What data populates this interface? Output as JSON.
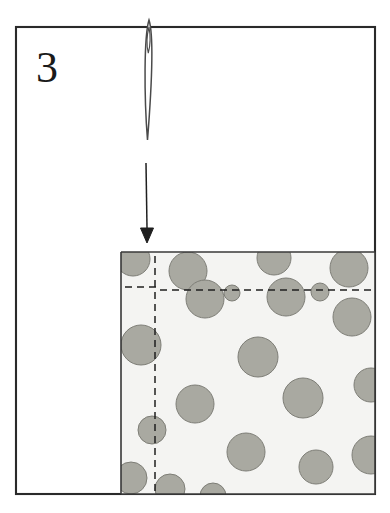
{
  "figure": {
    "kind": "sewing-instruction-diagram",
    "step_number": "3",
    "caption": "",
    "frame": {
      "name": "illustration-border",
      "x": 16,
      "y": 27,
      "width": 359,
      "height": 467,
      "stroke": "#2b2b2b",
      "fill": "#ffffff"
    }
  },
  "needle": {
    "name": "sewing-needle",
    "label": "needle",
    "tip_x": 149,
    "top_y": 20,
    "bottom_y": 140,
    "half_width": 5,
    "eye_top_y": 27,
    "eye_bottom_y": 53,
    "stroke": "#4a4a4a"
  },
  "arrow": {
    "name": "direction-arrow",
    "label": "fold direction arrow",
    "x": 146,
    "y_start": 163,
    "y_end": 243,
    "head_width": 13,
    "head_height": 16,
    "stroke": "#1f1f1f"
  },
  "fabric": {
    "name": "polka-dot-fabric",
    "label": "polka dot fabric piece",
    "x": 121,
    "y": 252,
    "width": 254,
    "height": 242,
    "background": "#f4f4f2",
    "outline": "#3a3a3a",
    "dot_fill": "#a9a9a1",
    "dot_stroke": "#7d7d76",
    "dots": [
      {
        "cx": 133,
        "cy": 259,
        "r": 17
      },
      {
        "cx": 188,
        "cy": 271,
        "r": 19
      },
      {
        "cx": 274,
        "cy": 258,
        "r": 17
      },
      {
        "cx": 349,
        "cy": 268,
        "r": 19
      },
      {
        "cx": 232,
        "cy": 293,
        "r": 8
      },
      {
        "cx": 320,
        "cy": 292,
        "r": 9
      },
      {
        "cx": 205,
        "cy": 299,
        "r": 19
      },
      {
        "cx": 286,
        "cy": 297,
        "r": 19
      },
      {
        "cx": 352,
        "cy": 317,
        "r": 19
      },
      {
        "cx": 141,
        "cy": 345,
        "r": 20
      },
      {
        "cx": 258,
        "cy": 357,
        "r": 20
      },
      {
        "cx": 195,
        "cy": 404,
        "r": 19
      },
      {
        "cx": 303,
        "cy": 398,
        "r": 20
      },
      {
        "cx": 371,
        "cy": 385,
        "r": 17
      },
      {
        "cx": 152,
        "cy": 430,
        "r": 14
      },
      {
        "cx": 246,
        "cy": 452,
        "r": 19
      },
      {
        "cx": 316,
        "cy": 467,
        "r": 17
      },
      {
        "cx": 371,
        "cy": 455,
        "r": 19
      },
      {
        "cx": 131,
        "cy": 478,
        "r": 16
      },
      {
        "cx": 170,
        "cy": 489,
        "r": 15
      },
      {
        "cx": 213,
        "cy": 496,
        "r": 13
      }
    ]
  },
  "fold_strip": {
    "name": "left-fold-strip",
    "label": "folded left edge",
    "left_x": 121,
    "right_x": 160,
    "dashed_x": 155,
    "top_y": 252,
    "bottom_y": 494,
    "stroke": "#3a3a3a",
    "dash_stroke": "#1f1f1f"
  },
  "top_fold": {
    "name": "top-fold-line",
    "label": "folded top edge",
    "left_dash_x1": 125,
    "left_dash_x2": 157,
    "left_dash_y": 287,
    "right_dash_x1": 160,
    "right_dash_x2": 375,
    "right_dash_y": 290,
    "solid_y": 293,
    "solid_x1": 160,
    "solid_x2": 375,
    "stroke": "#1f1f1f"
  },
  "colors": {
    "ink": "#1f1f1f",
    "frame_stroke": "#2b2b2b",
    "fabric_bg": "#f4f4f2",
    "dot_fill": "#a9a9a1",
    "dot_stroke": "#7d7d76",
    "page_bg": "#ffffff"
  }
}
